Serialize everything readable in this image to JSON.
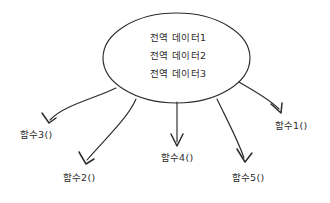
{
  "diagram": {
    "title": "",
    "type": "global-data-fan-out",
    "colors": {
      "background": "#ffffff",
      "stroke": "#2b2b2b",
      "text": "#2b2b2b"
    },
    "central_node": {
      "shape": "ellipse",
      "lines": [
        "전역 데이터1",
        "전역 데이터2",
        "전역 데이터3"
      ]
    },
    "leaves": [
      {
        "label": "함수3()",
        "direction": "down-left-far"
      },
      {
        "label": "함수2()",
        "direction": "down-left"
      },
      {
        "label": "함수4()",
        "direction": "down"
      },
      {
        "label": "함수5()",
        "direction": "down-right"
      },
      {
        "label": "함수1()",
        "direction": "down-right-far"
      }
    ],
    "edges": [
      {
        "from": "전역 데이터",
        "to": "함수3()",
        "style": "curved-arrow"
      },
      {
        "from": "전역 데이터",
        "to": "함수2()",
        "style": "curved-arrow"
      },
      {
        "from": "전역 데이터",
        "to": "함수4()",
        "style": "straight-arrow"
      },
      {
        "from": "전역 데이터",
        "to": "함수5()",
        "style": "curved-arrow"
      },
      {
        "from": "전역 데이터",
        "to": "함수1()",
        "style": "curved-arrow"
      }
    ]
  }
}
